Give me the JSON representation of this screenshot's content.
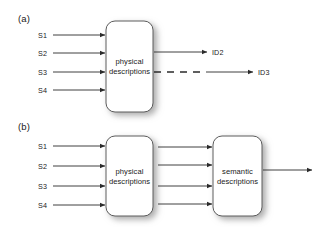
{
  "figure": {
    "panels": [
      {
        "id": "a",
        "label": "(a)",
        "label_x": 18,
        "label_y": 13,
        "inputs": [
          {
            "label": "S1",
            "x": 38,
            "y": 31,
            "arrow_y": 35
          },
          {
            "label": "S2",
            "x": 38,
            "y": 49,
            "arrow_y": 53
          },
          {
            "label": "S3",
            "x": 38,
            "y": 68,
            "arrow_y": 72
          },
          {
            "label": "S4",
            "x": 38,
            "y": 86,
            "arrow_y": 90
          }
        ],
        "input_arrow": {
          "x1": 53,
          "x2": 105
        },
        "blocks": [
          {
            "name": "physical-descriptions",
            "line1": "physical",
            "line2": "descriptions",
            "x": 106,
            "y": 21,
            "w": 47,
            "h": 91
          }
        ],
        "outputs": [
          {
            "label": "ID2",
            "style": "solid",
            "x1": 154,
            "x2": 207,
            "y": 52,
            "label_x": 212,
            "label_y": 48
          },
          {
            "label": "ID3",
            "style": "dashed-then-solid",
            "x1": 154,
            "x2": 253,
            "dash_end": 206,
            "y": 72,
            "label_x": 258,
            "label_y": 68
          }
        ]
      },
      {
        "id": "b",
        "label": "(b)",
        "label_x": 18,
        "label_y": 121,
        "inputs": [
          {
            "label": "S1",
            "x": 38,
            "y": 142,
            "arrow_y": 146
          },
          {
            "label": "S2",
            "x": 38,
            "y": 162,
            "arrow_y": 166
          },
          {
            "label": "S3",
            "x": 38,
            "y": 182,
            "arrow_y": 186
          },
          {
            "label": "S4",
            "x": 38,
            "y": 201,
            "arrow_y": 205
          }
        ],
        "input_arrow": {
          "x1": 53,
          "x2": 105
        },
        "blocks": [
          {
            "name": "physical-descriptions",
            "line1": "physical",
            "line2": "descriptions",
            "x": 106,
            "y": 136,
            "w": 47,
            "h": 80
          },
          {
            "name": "semantic-descriptions",
            "line1": "semantic",
            "line2": "descriptions",
            "x": 213,
            "y": 136,
            "w": 49,
            "h": 80
          }
        ],
        "middle_arrows": {
          "x1": 158,
          "x2": 212,
          "ys": [
            147,
            165,
            186,
            204
          ]
        },
        "outputs": [
          {
            "label": "",
            "style": "solid",
            "x1": 263,
            "x2": 312,
            "y": 170,
            "label_x": 316,
            "label_y": 166
          }
        ]
      }
    ],
    "style": {
      "background": "#ffffff",
      "line_color": "#2b2b2b",
      "box_border": "#4a4a4a",
      "box_fill": "#ffffff",
      "text_color": "#1a1a1a",
      "shadow_color": "#b0b0b0"
    }
  }
}
